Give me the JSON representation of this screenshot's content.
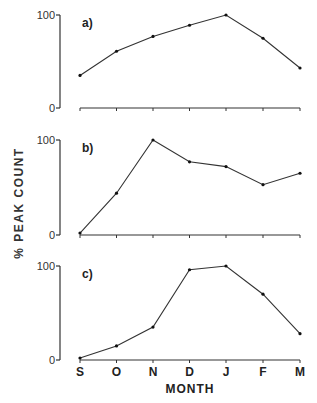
{
  "chart_data": [
    {
      "type": "line",
      "panel": "a)",
      "categories": [
        "S",
        "O",
        "N",
        "D",
        "J",
        "F",
        "M"
      ],
      "values": [
        35,
        61,
        77,
        89,
        100,
        75,
        43
      ],
      "ylim": [
        0,
        100
      ],
      "yticks": [
        "0",
        "100"
      ]
    },
    {
      "type": "line",
      "panel": "b)",
      "categories": [
        "S",
        "O",
        "N",
        "D",
        "J",
        "F",
        "M"
      ],
      "values": [
        2,
        44,
        100,
        77,
        72,
        53,
        65
      ],
      "ylim": [
        0,
        100
      ],
      "yticks": [
        "0",
        "100"
      ]
    },
    {
      "type": "line",
      "panel": "c)",
      "categories": [
        "S",
        "O",
        "N",
        "D",
        "J",
        "F",
        "M"
      ],
      "values": [
        2,
        15,
        35,
        96,
        100,
        70,
        28
      ],
      "ylim": [
        0,
        100
      ],
      "yticks": [
        "0",
        "100"
      ]
    }
  ],
  "labels": {
    "ylabel": "% PEAK COUNT",
    "xlabel": "MONTH",
    "months": [
      "S",
      "O",
      "N",
      "D",
      "J",
      "F",
      "M"
    ],
    "panels": [
      "a)",
      "b)",
      "c)"
    ]
  },
  "layout": {
    "grid": false,
    "legend": "none",
    "line_color": "#333333"
  }
}
